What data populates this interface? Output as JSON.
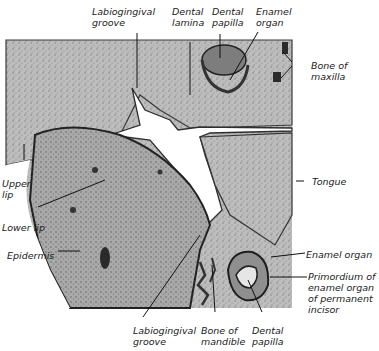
{
  "figure": {
    "type": "histology micrograph",
    "labels": {
      "labiogingival_groove_top": "Labiogingival\ngroove",
      "dental_lamina": "Dental\nlamina",
      "dental_papilla_top": "Dental\npapilla",
      "enamel_organ_top": "Enamel\norgan",
      "bone_of_maxilla": "Bone of\nmaxilla",
      "upper_lip": "Upper\nlip",
      "lower_lip": "Lower lip",
      "epidermis": "Epidermis",
      "tongue": "Tongue",
      "enamel_organ_bottom": "Enamel organ",
      "primordium": "Primordium of\nenamel organ\nof permanent\nincisor",
      "labiogingival_groove_bottom": "Labiogingival\ngroove",
      "bone_of_mandible": "Bone of\nmandible",
      "dental_papilla_bottom": "Dental\npapilla"
    },
    "colors": {
      "tissue_light": "#c8c8c8",
      "tissue_mid": "#a0a0a0",
      "tissue_dark": "#555555",
      "background": "#ffffff",
      "leader_line": "#111111"
    }
  }
}
